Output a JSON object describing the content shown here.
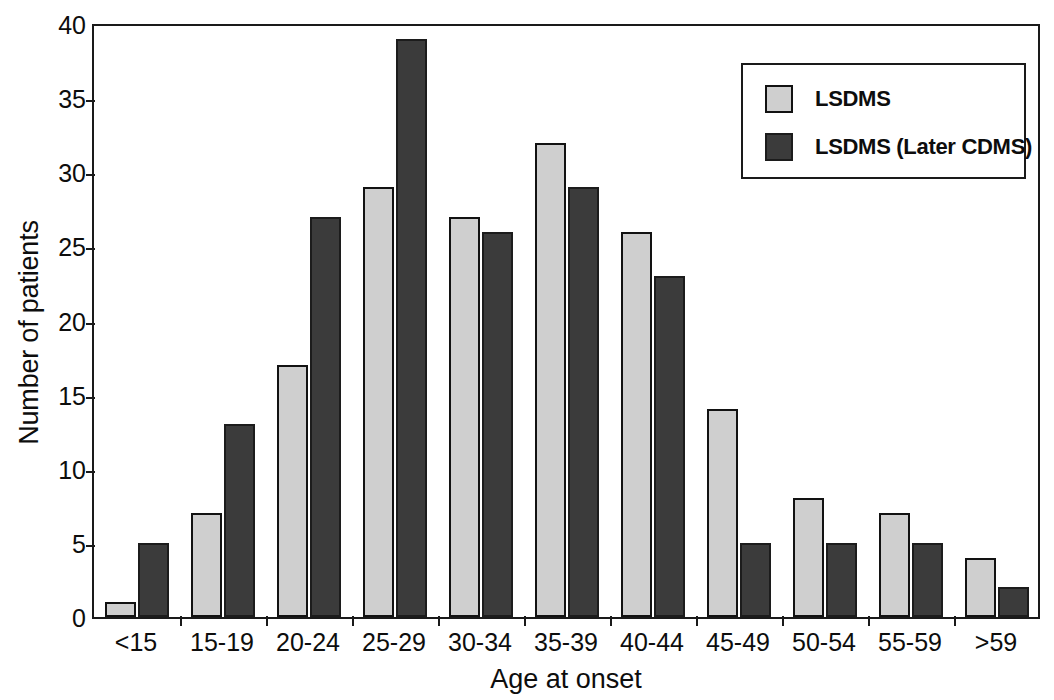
{
  "chart_data": {
    "type": "bar",
    "title": "",
    "xlabel": "Age at onset",
    "ylabel": "Number of patients",
    "categories": [
      "<15",
      "15-19",
      "20-24",
      "25-29",
      "30-34",
      "35-39",
      "40-44",
      "45-49",
      "50-54",
      "55-59",
      ">59"
    ],
    "series": [
      {
        "name": "LSDMS",
        "color": "#cfcfcf",
        "values": [
          1,
          7,
          17,
          29,
          27,
          32,
          26,
          14,
          8,
          7,
          4
        ]
      },
      {
        "name": "LSDMS (Later CDMS)",
        "color": "#3b3b3b",
        "values": [
          5,
          13,
          27,
          39,
          26,
          29,
          23,
          5,
          5,
          5,
          2
        ]
      }
    ],
    "ylim": [
      0,
      40
    ],
    "yticks": [
      0,
      5,
      10,
      15,
      20,
      25,
      30,
      35,
      40
    ],
    "ytick_labels": [
      "0",
      "5",
      "10",
      "15",
      "20",
      "25",
      "30",
      "35",
      "40"
    ],
    "grid": false,
    "legend_position": "top-right",
    "frame": true
  },
  "legend": {
    "entries": [
      {
        "label": "LSDMS"
      },
      {
        "label": "LSDMS (Later CDMS)"
      }
    ]
  }
}
